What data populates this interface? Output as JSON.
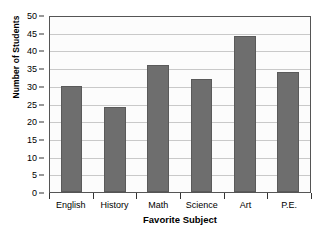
{
  "chart_data": {
    "type": "bar",
    "title": "",
    "title_cropped": true,
    "categories": [
      "English",
      "History",
      "Math",
      "Science",
      "Art",
      "P.E."
    ],
    "values": [
      30,
      24,
      36,
      32,
      44,
      34
    ],
    "series": [
      {
        "name": "Number of Students",
        "values": [
          30,
          24,
          36,
          32,
          44,
          34
        ]
      }
    ],
    "xlabel": "Favorite Subject",
    "ylabel": "Number of Students",
    "ylim": [
      0,
      50
    ],
    "ytick_step": 5,
    "yticks": [
      0,
      5,
      10,
      15,
      20,
      25,
      30,
      35,
      40,
      45,
      50
    ],
    "ytick_labels": [
      "0",
      "5",
      "10",
      "15",
      "20",
      "25",
      "30",
      "35",
      "40",
      "45",
      "50"
    ],
    "grid": true,
    "grid_axis": "y",
    "legend": false,
    "legend_position": "none",
    "bar_color": "#6e6e6e",
    "bar_edge_color": "#5a5a5a",
    "gridline_color": "#c9c9c9",
    "axis_color": "#555555",
    "plot_background": "#fcfcfc",
    "figure_background": "#ffffff"
  }
}
